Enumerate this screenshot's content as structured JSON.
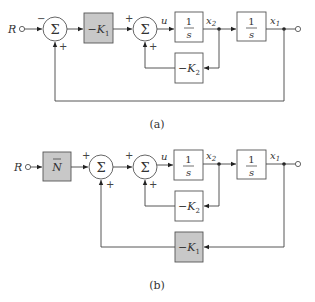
{
  "diagram_a": {
    "caption": "(a)",
    "input_label": "R",
    "sum1": {
      "symbol": "Σ",
      "sign_top": "−",
      "sign_bottom": "+"
    },
    "gain_k1": {
      "minus": "−",
      "K": "K",
      "sub": "1"
    },
    "sum2": {
      "symbol": "Σ",
      "sign_top": "+",
      "sign_bottom": "+"
    },
    "signal_u": "u",
    "integrator1": {
      "num": "1",
      "den": "s"
    },
    "signal_x2": {
      "x": "x",
      "sub": "2"
    },
    "integrator2": {
      "num": "1",
      "den": "s"
    },
    "signal_x1": {
      "x": "x",
      "sub": "1"
    },
    "gain_k2": {
      "minus": "−",
      "K": "K",
      "sub": "2"
    }
  },
  "diagram_b": {
    "caption": "(b)",
    "input_label": "R",
    "prefilter": {
      "label": "N",
      "bar": "‾"
    },
    "sum1": {
      "symbol": "Σ",
      "sign_top": "+",
      "sign_bottom": "+"
    },
    "sum2": {
      "symbol": "Σ",
      "sign_top": "+",
      "sign_bottom": "+"
    },
    "signal_u": "u",
    "integrator1": {
      "num": "1",
      "den": "s"
    },
    "signal_x2": {
      "x": "x",
      "sub": "2"
    },
    "integrator2": {
      "num": "1",
      "den": "s"
    },
    "signal_x1": {
      "x": "x",
      "sub": "1"
    },
    "gain_k2": {
      "minus": "−",
      "K": "K",
      "sub": "2"
    },
    "gain_k1": {
      "minus": "−",
      "K": "K",
      "sub": "1"
    }
  },
  "colors": {
    "shaded_block": "#c8c8c8",
    "line": "#444444"
  }
}
